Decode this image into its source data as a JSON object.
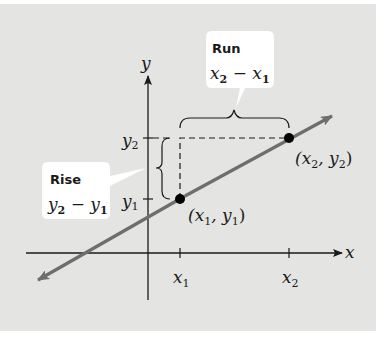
{
  "diagram": {
    "axes": {
      "x_label": "x",
      "y_label": "y",
      "x_ticks": [
        {
          "label": "x",
          "sub": "1"
        },
        {
          "label": "x",
          "sub": "2"
        }
      ],
      "y_ticks": [
        {
          "label": "y",
          "sub": "2"
        },
        {
          "label": "y",
          "sub": "1"
        }
      ]
    },
    "points": [
      {
        "name": "point-1",
        "label_open": "(x",
        "sub_a": "1",
        "mid": ", y",
        "sub_b": "1",
        "close": ")"
      },
      {
        "name": "point-2",
        "label_open": "(x",
        "sub_a": "2",
        "mid": ", y",
        "sub_b": "2",
        "close": ")"
      }
    ],
    "callouts": {
      "run": {
        "title": "Run",
        "expr_a": "x",
        "sub_a": "2",
        "op": " − ",
        "expr_b": "x",
        "sub_b": "1"
      },
      "rise": {
        "title": "Rise",
        "expr_a": "y",
        "sub_a": "2",
        "op": " − ",
        "expr_b": "y",
        "sub_b": "1"
      }
    },
    "colors": {
      "background": "#e4e4e2",
      "line": "#6e6e6e",
      "axis": "#1a1a1a",
      "point": "#000000",
      "callout_fill": "#ffffff"
    }
  }
}
